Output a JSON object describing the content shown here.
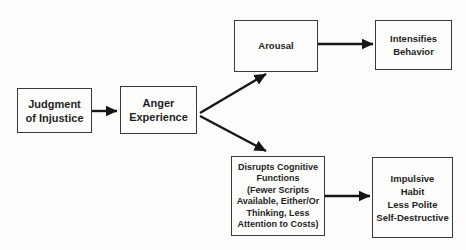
{
  "diagram": {
    "nodes": {
      "judgment_of_injustice": {
        "label": "Judgment\nof Injustice"
      },
      "anger_experience": {
        "label": "Anger\nExperience"
      },
      "arousal": {
        "label": "Arousal"
      },
      "intensifies_behavior": {
        "label": "Intensifies\nBehavior"
      },
      "disrupts_cognitive_functions": {
        "label": "Disrupts Cognitive\nFunctions\n(Fewer Scripts\nAvailable, Either/Or\nThinking, Less\nAttention to Costs)"
      },
      "impulsive_outcomes": {
        "label": "Impulsive\nHabit\nLess Polite\nSelf-Destructive"
      }
    },
    "edges": [
      {
        "from": "judgment_of_injustice",
        "to": "anger_experience"
      },
      {
        "from": "anger_experience",
        "to": "arousal"
      },
      {
        "from": "anger_experience",
        "to": "disrupts_cognitive_functions"
      },
      {
        "from": "arousal",
        "to": "intensifies_behavior"
      },
      {
        "from": "disrupts_cognitive_functions",
        "to": "impulsive_outcomes"
      }
    ],
    "colors": {
      "background": "#fdfdfb",
      "box_border": "#3a3a3a",
      "text": "#1f1f1f",
      "arrow": "#161616"
    }
  }
}
